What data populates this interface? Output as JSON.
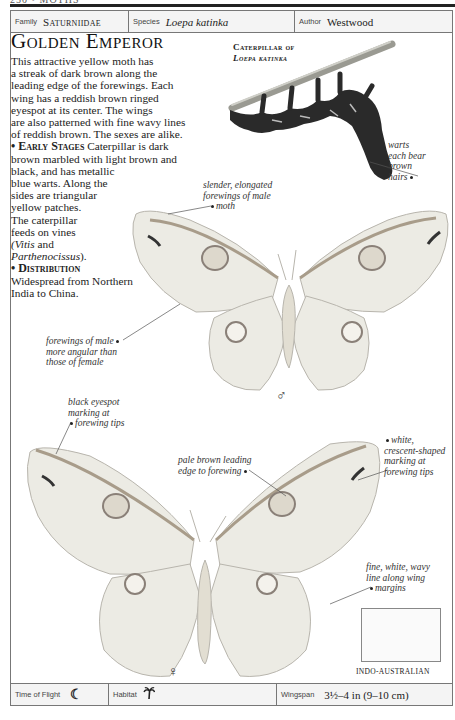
{
  "page": {
    "running_head": "250 • MOTHS"
  },
  "info_top": {
    "family_label": "Family",
    "family_value": "Saturniidae",
    "species_label": "Species",
    "species_value": "Loepa katinka",
    "author_label": "Author",
    "author_value": "Westwood"
  },
  "title": "Golden Emperor",
  "description": {
    "lines": [
      "This attractive yellow moth has",
      "a streak of dark brown along the",
      "leading edge of the forewings. Each",
      "wing has a reddish brown ringed",
      "eyespot at its center. The wings",
      "are also patterned with fine wavy lines",
      "of reddish brown. The sexes are alike."
    ],
    "early_stages_heading": "• Early Stages",
    "early_stages_lines": [
      " Caterpillar is dark",
      "brown marbled with light brown and",
      "black, and has metallic",
      "blue warts. Along the",
      "sides are triangular",
      "yellow patches.",
      "The caterpillar",
      "feeds on vines"
    ],
    "food_plant_1": "(Vitis",
    "food_plant_and": " and",
    "food_plant_2": "Parthenocissus",
    "food_plant_end": ").",
    "distribution_heading": "• Distribution",
    "distribution_lines": [
      "Widespread from Northern",
      "India to China."
    ]
  },
  "caterpillar": {
    "title_line1": "Caterpillar of",
    "title_line2": "Loepa katinka"
  },
  "callouts": {
    "warts": [
      "warts",
      "each bear",
      "brown",
      "hairs"
    ],
    "slender_forewings": [
      "slender, elongated",
      "forewings of male",
      "moth"
    ],
    "forewings_angular": [
      "forewings of male",
      "more angular than",
      "those of female"
    ],
    "black_eyespot": [
      "black eyespot",
      "marking at",
      "forewing tips"
    ],
    "pale_brown_edge": [
      "pale brown leading",
      "edge to forewing"
    ],
    "white_crescent": [
      "white,",
      "crescent-shaped",
      "marking at",
      "forewing tips"
    ],
    "wavy_line": [
      "fine, white, wavy",
      "line along wing",
      "margins"
    ]
  },
  "symbols": {
    "male": "♂",
    "female": "♀"
  },
  "map": {
    "region_label": "INDO-AUSTRALIAN"
  },
  "info_bottom": {
    "flight_label": "Time of Flight",
    "flight_icon": "☾",
    "habitat_label": "Habitat",
    "habitat_icon": "palm-tree-icon",
    "wingspan_label": "Wingspan",
    "wingspan_value": "3½–4 in (9–10 cm)"
  },
  "colors": {
    "wing_fill": "#ecebe4",
    "wing_line": "#8a8780",
    "caterpillar": "#2a2a2a",
    "twig": "#9a9a92",
    "map_land": "#4a4a4a"
  }
}
